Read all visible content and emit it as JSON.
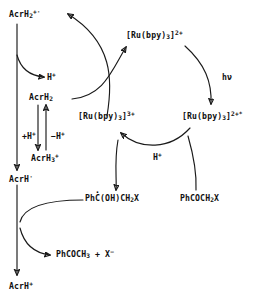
{
  "diagram": {
    "type": "reaction-scheme",
    "stroke_color": "#1a1a1a",
    "background_color": "#ffffff",
    "species": {
      "acrh2_radical_cation": "AcrH2+·",
      "proton_1": "H+",
      "acrh2": "AcrH2",
      "acrh3_cation": "AcrH3+",
      "acrh_radical": "AcrH·",
      "acrh_cation": "AcrH+",
      "ru_2plus": "[Ru(bpy)3]2+",
      "ru_3plus": "[Ru(bpy)3]3+",
      "ru_2plus_excited": "[Ru(bpy)3]2+*",
      "photon": "hν",
      "proton_2": "H+",
      "ketyl_radical": "PhC·(OH)CH2X",
      "phenacyl_halide": "PhCOCH2X",
      "acetophenone_plus_halide": "PhCOCH3 + X−",
      "plus_proton": "+H+",
      "minus_proton": "−H+"
    },
    "labels": {
      "acrh2_radical_cation": {
        "head": "AcrH",
        "sub": "2",
        "sup": "+·"
      },
      "proton_1": {
        "head": "H",
        "sup": "+"
      },
      "acrh2": {
        "head": "AcrH",
        "sub": "2"
      },
      "acrh3_cation": {
        "head": "AcrH",
        "sub": "3",
        "sup": "+"
      },
      "acrh_radical": {
        "head": "AcrH",
        "sup": "·"
      },
      "acrh_cation": {
        "head": "AcrH",
        "sup": "+"
      },
      "ru_2plus": {
        "head": "[Ru(bpy)",
        "sub": "3",
        "tail": "]",
        "sup": "2+"
      },
      "ru_3plus": {
        "head": "[Ru(bpy)",
        "sub": "3",
        "tail": "]",
        "sup": "3+"
      },
      "ru_2plus_excited": {
        "head": "[Ru(bpy)",
        "sub": "3",
        "tail": "]",
        "sup": "2+*"
      },
      "photon": {
        "head": "hν"
      },
      "proton_2": {
        "head": "H",
        "sup": "+"
      },
      "plus_proton": {
        "head": "+H",
        "sup": "+"
      },
      "minus_proton": {
        "head": "−H",
        "sup": "+"
      },
      "ketyl_radical": {
        "p1": "Ph",
        "radical_c": "C",
        "p2": "(OH)CH",
        "sub": "2",
        "p3": "X"
      },
      "phenacyl_halide": {
        "p1": "PhCOCH",
        "sub": "2",
        "p2": "X"
      },
      "acetophenone_product": {
        "p1": "PhCOCH",
        "sub": "3",
        "p2": " + X",
        "sup": "−"
      }
    }
  }
}
